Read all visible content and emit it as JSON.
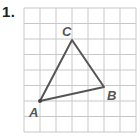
{
  "problem": {
    "number_label": "1."
  },
  "grid": {
    "x0": 24,
    "y0": 8,
    "cols": 7,
    "rows": 8,
    "cell_w": 16,
    "cell_h": 15.5,
    "color": "#c8c8c8"
  },
  "triangle": {
    "stroke": "#555555",
    "vertices": [
      {
        "name": "A",
        "x": 40,
        "y": 101,
        "label": "A",
        "lx": 29,
        "ly": 117
      },
      {
        "name": "B",
        "x": 104,
        "y": 87,
        "label": "B",
        "lx": 107,
        "ly": 100
      },
      {
        "name": "C",
        "x": 72,
        "y": 40,
        "label": "C",
        "lx": 62,
        "ly": 36
      }
    ]
  }
}
